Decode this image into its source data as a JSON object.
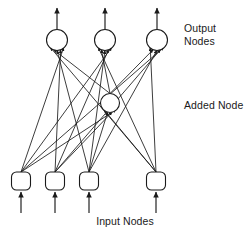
{
  "diagram": {
    "type": "neural-network-topology",
    "title": "",
    "stroke_color": "#1a1a1a",
    "fill_color": "#ffffff",
    "background": "#ffffff",
    "labels": {
      "output_nodes": "Output\nNodes",
      "added_node": "Added Node",
      "input_nodes": "Input Nodes"
    },
    "layers": {
      "output": {
        "name": "Output Nodes",
        "shape": "circle",
        "count": 3,
        "radius": 10.5,
        "nodes": [
          {
            "id": "out1",
            "cx": 57,
            "cy": 40
          },
          {
            "id": "out2",
            "cx": 105,
            "cy": 40
          },
          {
            "id": "out3",
            "cx": 157,
            "cy": 40
          }
        ]
      },
      "added": {
        "name": "Added Node",
        "shape": "circle",
        "count": 1,
        "radius": 9.5,
        "nodes": [
          {
            "id": "add1",
            "cx": 110,
            "cy": 103
          }
        ]
      },
      "input": {
        "name": "Input Nodes",
        "shape": "rounded-square",
        "count": 4,
        "box_width": 19,
        "box_height": 18,
        "corner_radius": 5,
        "nodes": [
          {
            "id": "in1",
            "cx": 21,
            "cy": 181
          },
          {
            "id": "in2",
            "cx": 55,
            "cy": 181
          },
          {
            "id": "in3",
            "cx": 89,
            "cy": 181
          },
          {
            "id": "in4",
            "cx": 156,
            "cy": 181
          }
        ]
      }
    },
    "external_arrows": {
      "outgoing_from_output": [
        {
          "x": 57,
          "y_from": 29,
          "y_to": 8
        },
        {
          "x": 105,
          "y_from": 29,
          "y_to": 8
        },
        {
          "x": 157,
          "y_from": 29,
          "y_to": 8
        }
      ],
      "incoming_to_input": [
        {
          "x": 21,
          "y_from": 213,
          "y_to": 192
        },
        {
          "x": 55,
          "y_from": 213,
          "y_to": 192
        },
        {
          "x": 89,
          "y_from": 213,
          "y_to": 192
        },
        {
          "x": 156,
          "y_from": 213,
          "y_to": 192
        }
      ]
    },
    "edges": {
      "description": "Every input node connects to every output node and to the added node; the added node also connects to every output node.",
      "input_to_output_count": 12,
      "input_to_added_count": 4,
      "added_to_output_count": 3,
      "total_count": 19,
      "list": [
        {
          "from": "in1",
          "to": "out1"
        },
        {
          "from": "in2",
          "to": "out1"
        },
        {
          "from": "in3",
          "to": "out1"
        },
        {
          "from": "in4",
          "to": "out1"
        },
        {
          "from": "in1",
          "to": "out2"
        },
        {
          "from": "in2",
          "to": "out2"
        },
        {
          "from": "in3",
          "to": "out2"
        },
        {
          "from": "in4",
          "to": "out2"
        },
        {
          "from": "in1",
          "to": "out3"
        },
        {
          "from": "in2",
          "to": "out3"
        },
        {
          "from": "in3",
          "to": "out3"
        },
        {
          "from": "in4",
          "to": "out3"
        },
        {
          "from": "in1",
          "to": "add1"
        },
        {
          "from": "in2",
          "to": "add1"
        },
        {
          "from": "in3",
          "to": "add1"
        },
        {
          "from": "in4",
          "to": "add1"
        },
        {
          "from": "add1",
          "to": "out1"
        },
        {
          "from": "add1",
          "to": "out2"
        },
        {
          "from": "add1",
          "to": "out3"
        }
      ]
    }
  }
}
